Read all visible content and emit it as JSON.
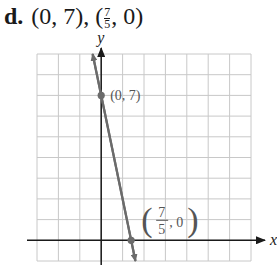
{
  "header": {
    "part_label": "d.",
    "points_text_prefix": "(0, 7), (",
    "frac_num": "7",
    "frac_den": "5",
    "points_text_suffix": ", 0)"
  },
  "chart_data": {
    "type": "line",
    "xlabel": "x",
    "ylabel": "y",
    "xlim": [
      -3,
      7
    ],
    "ylim": [
      -1,
      9
    ],
    "grid": true,
    "grid_step": 1,
    "series": [
      {
        "name": "line through intercepts",
        "equation": "y = -5x + 7",
        "x": [
          -0.4,
          1.6
        ],
        "y": [
          9,
          -1
        ],
        "color": "#6b6b6b"
      }
    ],
    "points": [
      {
        "x": 0,
        "y": 7,
        "label": "(0, 7)"
      },
      {
        "x": 1.4,
        "y": 0,
        "label": "(7/5, 0)",
        "label_num": "7",
        "label_den": "5"
      }
    ],
    "colors": {
      "grid": "#c8c8c8",
      "axis": "#1a1a1a",
      "line": "#6b6b6b",
      "label": "#555555"
    }
  }
}
